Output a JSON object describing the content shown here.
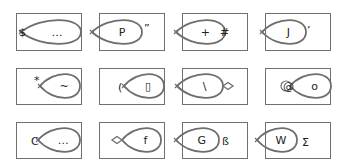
{
  "grid": {
    "rows": 3,
    "cols": 4,
    "stroke_color": "#707070",
    "loop_color": "#6e6e6e",
    "text_color": "#222222",
    "cells": [
      {
        "row": 0,
        "col": 0,
        "box": [
          16,
          13,
          65,
          37
        ],
        "loop": {
          "tip": [
            21,
            32
          ],
          "end": [
            81,
            32
          ],
          "dir": "right",
          "tip_mark": "x"
        },
        "inner": "…",
        "outer": [
          {
            "t": "$",
            "x": 19,
            "y": 36
          }
        ]
      },
      {
        "row": 0,
        "col": 1,
        "box": [
          99,
          13,
          65,
          37
        ],
        "loop": {
          "tip": [
            92,
            32
          ],
          "end": [
            142,
            32
          ],
          "dir": "right",
          "tip_mark": "x"
        },
        "inner": "P",
        "outer": [
          {
            "t": "”",
            "x": 144,
            "y": 32
          }
        ]
      },
      {
        "row": 0,
        "col": 2,
        "box": [
          182,
          13,
          65,
          37
        ],
        "loop": {
          "tip": [
            176,
            32
          ],
          "end": [
            225,
            32
          ],
          "dir": "right",
          "tip_mark": "x"
        },
        "inner": "+",
        "outer": [
          {
            "t": "#",
            "x": 220,
            "y": 36
          }
        ]
      },
      {
        "row": 0,
        "col": 3,
        "box": [
          265,
          13,
          65,
          37
        ],
        "loop": {
          "tip": [
            262,
            32
          ],
          "end": [
            306,
            32
          ],
          "dir": "right",
          "tip_mark": "x"
        },
        "inner": "J",
        "outer": [
          {
            "t": "’",
            "x": 307,
            "y": 34
          }
        ]
      },
      {
        "row": 1,
        "col": 0,
        "box": [
          16,
          68,
          65,
          36
        ],
        "loop": {
          "tip": [
            40,
            86
          ],
          "end": [
            80,
            86
          ],
          "dir": "right",
          "tip_mark": "x"
        },
        "inner": "~",
        "outer": [
          {
            "t": "*",
            "x": 34,
            "y": 84
          }
        ]
      },
      {
        "row": 1,
        "col": 1,
        "box": [
          99,
          68,
          65,
          36
        ],
        "loop": {
          "tip": [
            124,
            86
          ],
          "end": [
            164,
            86
          ],
          "dir": "right",
          "tip_mark": "x"
        },
        "inner": "▯",
        "outer": [
          {
            "t": "(",
            "x": 118,
            "y": 91
          }
        ]
      },
      {
        "row": 1,
        "col": 2,
        "box": [
          182,
          68,
          65,
          36
        ],
        "loop": {
          "tip": [
            177,
            86
          ],
          "end": [
            223,
            86
          ],
          "dir": "right",
          "tip_mark": "x",
          "tail_diamond": true
        },
        "inner": "\\",
        "outer": []
      },
      {
        "row": 1,
        "col": 3,
        "box": [
          265,
          68,
          65,
          36
        ],
        "loop": {
          "tip": [
            290,
            86
          ],
          "end": [
            331,
            86
          ],
          "dir": "right",
          "tip_mark": "circle"
        },
        "inner": "o",
        "outer": [
          {
            "t": "@",
            "x": 283,
            "y": 90
          }
        ]
      },
      {
        "row": 2,
        "col": 0,
        "box": [
          16,
          122,
          65,
          36
        ],
        "loop": {
          "tip": [
            38,
            140
          ],
          "end": [
            80,
            140
          ],
          "dir": "right",
          "tip_mark": "x"
        },
        "inner": "…",
        "outer": [
          {
            "t": "C",
            "x": 31,
            "y": 145
          }
        ]
      },
      {
        "row": 2,
        "col": 1,
        "box": [
          99,
          122,
          65,
          36
        ],
        "loop": {
          "tip": [
            122,
            140
          ],
          "end": [
            161,
            140
          ],
          "dir": "right",
          "tip_mark": "none",
          "head_diamond": true
        },
        "inner": "f",
        "outer": []
      },
      {
        "row": 2,
        "col": 2,
        "box": [
          182,
          122,
          65,
          36
        ],
        "loop": {
          "tip": [
            176,
            140
          ],
          "end": [
            219,
            140
          ],
          "dir": "right",
          "tip_mark": "x"
        },
        "inner": "G",
        "outer": [
          {
            "t": "ß",
            "x": 222,
            "y": 145
          }
        ]
      },
      {
        "row": 2,
        "col": 3,
        "box": [
          265,
          122,
          65,
          36
        ],
        "loop": {
          "tip": [
            257,
            140
          ],
          "end": [
            297,
            140
          ],
          "dir": "right",
          "tip_mark": "x"
        },
        "inner": "W",
        "outer": [
          {
            "t": "Σ",
            "x": 302,
            "y": 146
          }
        ]
      }
    ]
  }
}
